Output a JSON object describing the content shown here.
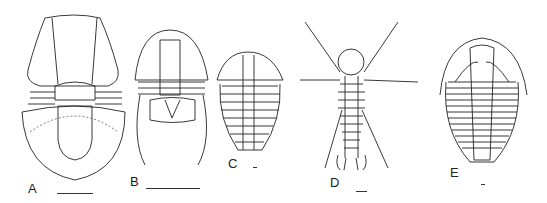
{
  "figure": {
    "panels": [
      {
        "label": "A",
        "subject": "trilobite-like arthropod, large cephalon and semicircular pygidium"
      },
      {
        "label": "B",
        "subject": "trilobite with long genal spines"
      },
      {
        "label": "C",
        "subject": "small trilobite with segmented thorax"
      },
      {
        "label": "D",
        "subject": "spiny arthropod with long lateral spines"
      },
      {
        "label": "E",
        "subject": "trilobite with many thoracic segments"
      }
    ],
    "scale_bars": [
      "A",
      "B",
      "C",
      "D",
      "E"
    ]
  }
}
